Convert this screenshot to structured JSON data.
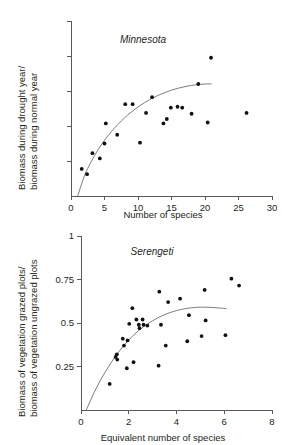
{
  "figure": {
    "panels": [
      "minnesota",
      "serengeti"
    ]
  },
  "chart_data": [
    {
      "id": "minnesota",
      "type": "scatter",
      "title": "Minnesota",
      "xlabel": "Number of species",
      "ylabel": "Biomass during drought year/\nbiomass during normal year",
      "ylabel_line1": "Biomass during drought year/",
      "ylabel_line2": "biomass during normal year",
      "xlim": [
        0,
        30
      ],
      "ylim": [
        0,
        1
      ],
      "xticks": [
        0,
        5,
        10,
        15,
        20,
        25,
        30
      ],
      "xticklabels": [
        "0",
        "5",
        "10",
        "15",
        "20",
        "25",
        "30"
      ],
      "yticks": [
        0.2,
        0.4,
        0.6,
        0.8,
        1.0
      ],
      "yticklabels": [
        "",
        "",
        "",
        "",
        ""
      ],
      "grid": false,
      "legend": "none",
      "points": [
        [
          1.6,
          0.155
        ],
        [
          2.4,
          0.125
        ],
        [
          3.2,
          0.245
        ],
        [
          4.3,
          0.215
        ],
        [
          5.0,
          0.3
        ],
        [
          5.2,
          0.415
        ],
        [
          6.9,
          0.35
        ],
        [
          8.1,
          0.525
        ],
        [
          9.2,
          0.525
        ],
        [
          10.3,
          0.305
        ],
        [
          11.2,
          0.475
        ],
        [
          12.1,
          0.565
        ],
        [
          13.8,
          0.415
        ],
        [
          14.3,
          0.44
        ],
        [
          14.9,
          0.505
        ],
        [
          15.9,
          0.51
        ],
        [
          16.6,
          0.505
        ],
        [
          18.0,
          0.47
        ],
        [
          19.0,
          0.64
        ],
        [
          20.4,
          0.42
        ],
        [
          20.9,
          0.79
        ],
        [
          26.2,
          0.475
        ]
      ],
      "fit_curve": {
        "description": "saturating log-like fit",
        "points": [
          [
            1.0,
            0.0
          ],
          [
            2.0,
            0.115
          ],
          [
            3.0,
            0.195
          ],
          [
            4.0,
            0.262
          ],
          [
            5.0,
            0.318
          ],
          [
            6.0,
            0.367
          ],
          [
            7.0,
            0.409
          ],
          [
            8.0,
            0.447
          ],
          [
            9.0,
            0.48
          ],
          [
            10.0,
            0.509
          ],
          [
            11.0,
            0.534
          ],
          [
            12.0,
            0.556
          ],
          [
            13.0,
            0.575
          ],
          [
            14.0,
            0.591
          ],
          [
            15.0,
            0.605
          ],
          [
            16.0,
            0.616
          ],
          [
            17.0,
            0.625
          ],
          [
            18.0,
            0.632
          ],
          [
            19.0,
            0.637
          ],
          [
            20.0,
            0.64
          ],
          [
            21.0,
            0.641
          ]
        ]
      }
    },
    {
      "id": "serengeti",
      "type": "scatter",
      "title": "Serengeti",
      "xlabel": "Equivalent number of species",
      "ylabel": "Biomass of vegetation grazed plots/\nbiomass of vegetation ungrazed plots",
      "ylabel_line1": "Biomass of vegetation grazed plots/",
      "ylabel_line2": "biomass of vegetation ungrazed plots",
      "xlim": [
        0,
        8
      ],
      "ylim": [
        0,
        1
      ],
      "xticks": [
        0,
        2,
        4,
        6,
        8
      ],
      "xticklabels": [
        "0",
        "2",
        "4",
        "6",
        "8"
      ],
      "yticks": [
        0.25,
        0.5,
        0.75,
        1
      ],
      "yticklabels": [
        "0.25",
        "0.5",
        "0.75",
        "1"
      ],
      "grid": false,
      "legend": "none",
      "points": [
        [
          1.2,
          0.15
        ],
        [
          1.45,
          0.305
        ],
        [
          1.5,
          0.32
        ],
        [
          1.52,
          0.29
        ],
        [
          1.75,
          0.41
        ],
        [
          1.8,
          0.37
        ],
        [
          1.92,
          0.24
        ],
        [
          1.95,
          0.4
        ],
        [
          2.02,
          0.495
        ],
        [
          2.15,
          0.585
        ],
        [
          2.2,
          0.275
        ],
        [
          2.32,
          0.52
        ],
        [
          2.42,
          0.49
        ],
        [
          2.45,
          0.47
        ],
        [
          2.58,
          0.52
        ],
        [
          2.62,
          0.49
        ],
        [
          2.78,
          0.485
        ],
        [
          3.25,
          0.255
        ],
        [
          3.28,
          0.68
        ],
        [
          3.35,
          0.49
        ],
        [
          3.55,
          0.37
        ],
        [
          3.65,
          0.62
        ],
        [
          4.15,
          0.64
        ],
        [
          4.45,
          0.395
        ],
        [
          4.52,
          0.545
        ],
        [
          5.05,
          0.425
        ],
        [
          5.18,
          0.69
        ],
        [
          5.22,
          0.515
        ],
        [
          6.05,
          0.43
        ],
        [
          6.3,
          0.755
        ],
        [
          6.62,
          0.715
        ]
      ],
      "fit_curve": {
        "description": "humped saturating fit",
        "points": [
          [
            0.22,
            0.0
          ],
          [
            0.6,
            0.115
          ],
          [
            1.0,
            0.215
          ],
          [
            1.4,
            0.3
          ],
          [
            1.8,
            0.372
          ],
          [
            2.2,
            0.43
          ],
          [
            2.6,
            0.477
          ],
          [
            3.0,
            0.513
          ],
          [
            3.4,
            0.542
          ],
          [
            3.8,
            0.563
          ],
          [
            4.2,
            0.578
          ],
          [
            4.6,
            0.587
          ],
          [
            5.0,
            0.591
          ],
          [
            5.4,
            0.59
          ],
          [
            5.8,
            0.586
          ],
          [
            6.1,
            0.582
          ]
        ]
      }
    }
  ]
}
